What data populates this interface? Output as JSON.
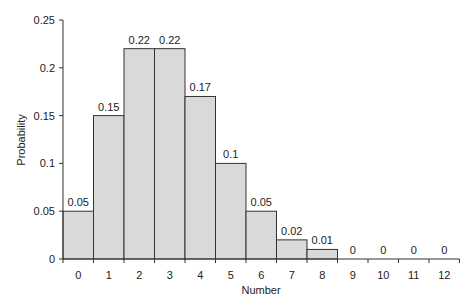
{
  "chart_data": {
    "type": "bar",
    "title": "",
    "xlabel": "Number",
    "ylabel": "Probability",
    "categories": [
      "0",
      "1",
      "2",
      "3",
      "4",
      "5",
      "6",
      "7",
      "8",
      "9",
      "10",
      "11",
      "12"
    ],
    "values": [
      0.05,
      0.15,
      0.22,
      0.22,
      0.17,
      0.1,
      0.05,
      0.02,
      0.01,
      0,
      0,
      0,
      0
    ],
    "value_labels": [
      "0.05",
      "0.15",
      "0.22",
      "0.22",
      "0.17",
      "0.1",
      "0.05",
      "0.02",
      "0.01",
      "0",
      "0",
      "0",
      "0"
    ],
    "ylim": [
      0,
      0.25
    ],
    "yticks": [
      "0",
      "0.05",
      "0.1",
      "0.15",
      "0.2",
      "0.25"
    ],
    "grid": false,
    "legend": null,
    "bar_color": "#d9d9d9",
    "edge_color": "#333333"
  }
}
